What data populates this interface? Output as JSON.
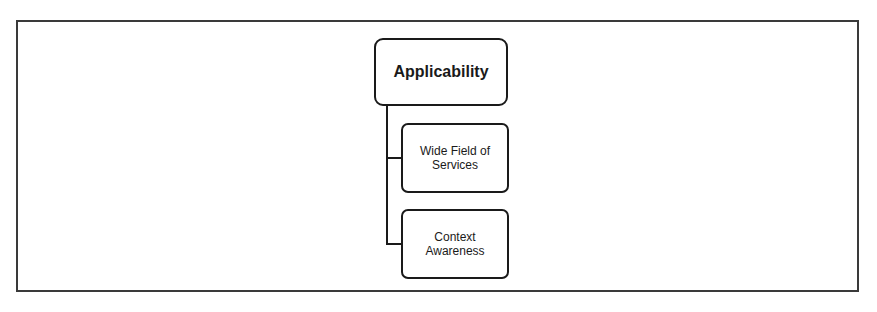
{
  "diagram": {
    "type": "hierarchy",
    "root": {
      "label": "Applicability"
    },
    "children": [
      {
        "label": "Wide Field of Services"
      },
      {
        "label": "Context Awareness"
      }
    ],
    "colors": {
      "stroke": "#1a1a1a",
      "frame": "#3a3a3a",
      "background": "#ffffff"
    }
  }
}
